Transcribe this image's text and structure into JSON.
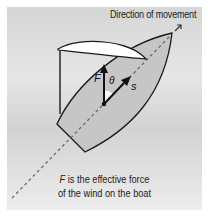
{
  "figure": {
    "direction_label": "Direction of movement",
    "force_label": "F",
    "angle_label": "θ",
    "displacement_label": "s",
    "caption": {
      "line1_var": "F",
      "line1_rest": " is the effective force",
      "line2": "of the wind on the boat"
    },
    "colors": {
      "background": "#dcdcdc",
      "hull_fill": "#c9c9c9",
      "sail_fill": "#ffffff",
      "stroke": "#1a1a1a",
      "dashed_line": "#666666"
    }
  }
}
